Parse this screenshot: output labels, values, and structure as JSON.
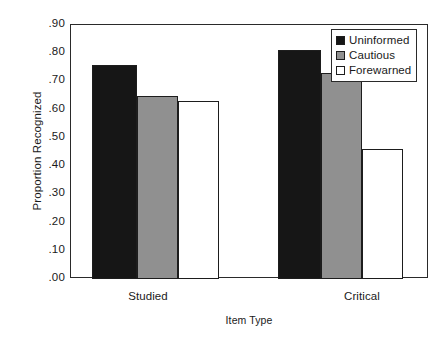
{
  "chart_data": {
    "type": "bar",
    "title": "",
    "xlabel": "Item Type",
    "ylabel": "Proportion Recognized",
    "categories": [
      "Studied",
      "Critical"
    ],
    "series": [
      {
        "name": "Uninformed",
        "values": [
          0.76,
          0.81
        ],
        "color": "#161616"
      },
      {
        "name": "Cautious",
        "values": [
          0.65,
          0.73
        ],
        "color": "#909090"
      },
      {
        "name": "Forewarned",
        "values": [
          0.63,
          0.46
        ],
        "color": "#ffffff"
      }
    ],
    "ylim": [
      0.0,
      0.9
    ],
    "ytick_values": [
      0.9,
      0.8,
      0.7,
      0.6,
      0.5,
      0.4,
      0.3,
      0.2,
      0.1,
      0.0
    ],
    "ytick_labels": [
      ".90",
      ".80",
      ".70",
      ".60",
      ".50",
      ".40",
      ".30",
      ".20",
      ".10",
      ".00"
    ],
    "grid": false,
    "legend_position": "top-right"
  },
  "axes": {
    "y_title": "Proportion Recognized",
    "x_title": "Item Type",
    "y_ticks": [
      {
        "label": ".90",
        "value": 0.9
      },
      {
        "label": ".80",
        "value": 0.8
      },
      {
        "label": ".70",
        "value": 0.7
      },
      {
        "label": ".60",
        "value": 0.6
      },
      {
        "label": ".50",
        "value": 0.5
      },
      {
        "label": ".40",
        "value": 0.4
      },
      {
        "label": ".30",
        "value": 0.3
      },
      {
        "label": ".20",
        "value": 0.2
      },
      {
        "label": ".10",
        "value": 0.1
      },
      {
        "label": ".00",
        "value": 0.0
      }
    ],
    "x_ticks": [
      {
        "label": "Studied"
      },
      {
        "label": "Critical"
      }
    ]
  },
  "legend": {
    "items": [
      {
        "label": "Uninformed",
        "swatch": "black-square-swatch"
      },
      {
        "label": "Cautious",
        "swatch": "gray-square-swatch"
      },
      {
        "label": "Forewarned",
        "swatch": "white-square-swatch"
      }
    ]
  },
  "bars": [
    {
      "group": "Studied",
      "series": "Uninformed",
      "value": 0.76,
      "left": 91,
      "width": 45
    },
    {
      "group": "Studied",
      "series": "Cautious",
      "value": 0.65,
      "left": 136,
      "width": 41
    },
    {
      "group": "Studied",
      "series": "Forewarned",
      "value": 0.63,
      "left": 177,
      "width": 41
    },
    {
      "group": "Critical",
      "series": "Uninformed",
      "value": 0.81,
      "left": 277,
      "width": 43
    },
    {
      "group": "Critical",
      "series": "Cautious",
      "value": 0.73,
      "left": 320,
      "width": 41
    },
    {
      "group": "Critical",
      "series": "Forewarned",
      "value": 0.46,
      "left": 361,
      "width": 41
    }
  ],
  "geometry": {
    "plot_left": 70,
    "plot_top": 24,
    "plot_width": 358,
    "plot_height": 254,
    "y_min": 0.0,
    "y_max": 0.9,
    "group_label_left": [
      78,
      292
    ]
  }
}
